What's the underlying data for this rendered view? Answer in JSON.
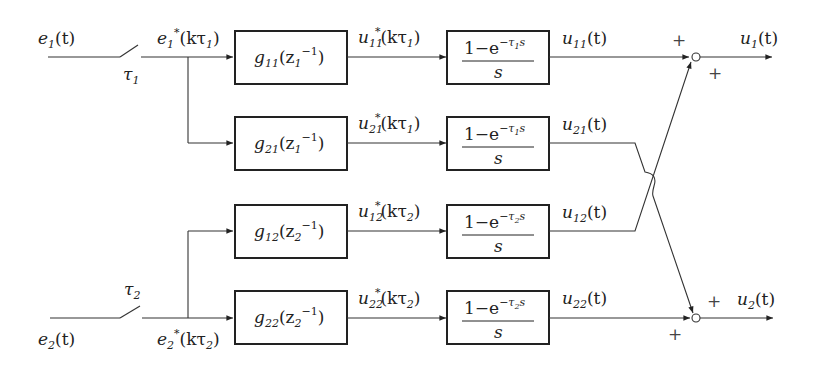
{
  "inputs": {
    "e1": {
      "base": "e",
      "sub": "1",
      "arg": "(t)"
    },
    "e2": {
      "base": "e",
      "sub": "2",
      "arg": "(t)"
    }
  },
  "samplers": {
    "s1": {
      "base": "τ",
      "sub": "1"
    },
    "s2": {
      "base": "τ",
      "sub": "2"
    }
  },
  "sampled": {
    "e1s": {
      "base": "e",
      "sub": "1",
      "sup": "*",
      "arg": "(kτ",
      "argsub": "1",
      "close": ")"
    },
    "e2s": {
      "base": "e",
      "sub": "2",
      "sup": "*",
      "arg": "(kτ",
      "argsub": "2",
      "close": ")"
    }
  },
  "controllers": [
    {
      "id": "g11",
      "base": "g",
      "sub": "11",
      "arg": "(z",
      "argsub": "1",
      "argsup": "−1",
      "close": ")"
    },
    {
      "id": "g21",
      "base": "g",
      "sub": "21",
      "arg": "(z",
      "argsub": "1",
      "argsup": "−1",
      "close": ")"
    },
    {
      "id": "g12",
      "base": "g",
      "sub": "12",
      "arg": "(z",
      "argsub": "2",
      "argsup": "−1",
      "close": ")"
    },
    {
      "id": "g22",
      "base": "g",
      "sub": "22",
      "arg": "(z",
      "argsub": "2",
      "argsup": "−1",
      "close": ")"
    }
  ],
  "controller_outputs": [
    {
      "base": "u",
      "sub": "11",
      "sup": "*",
      "arg": "(kτ",
      "argsub": "1",
      "close": ")"
    },
    {
      "base": "u",
      "sub": "21",
      "sup": "*",
      "arg": "(kτ",
      "argsub": "1",
      "close": ")"
    },
    {
      "base": "u",
      "sub": "12",
      "sup": "*",
      "arg": "(kτ",
      "argsub": "2",
      "close": ")"
    },
    {
      "base": "u",
      "sub": "22",
      "sup": "*",
      "arg": "(kτ",
      "argsub": "2",
      "close": ")"
    }
  ],
  "holds": [
    {
      "num": "1−e",
      "exp": "−τ",
      "expsub": "1",
      "expvar": "s",
      "den": "s"
    },
    {
      "num": "1−e",
      "exp": "−τ",
      "expsub": "1",
      "expvar": "s",
      "den": "s"
    },
    {
      "num": "1−e",
      "exp": "−τ",
      "expsub": "2",
      "expvar": "s",
      "den": "s"
    },
    {
      "num": "1−e",
      "exp": "−τ",
      "expsub": "2",
      "expvar": "s",
      "den": "s"
    }
  ],
  "hold_outputs": [
    {
      "base": "u",
      "sub": "11",
      "arg": "(t)"
    },
    {
      "base": "u",
      "sub": "21",
      "arg": "(t)"
    },
    {
      "base": "u",
      "sub": "12",
      "arg": "(t)"
    },
    {
      "base": "u",
      "sub": "22",
      "arg": "(t)"
    }
  ],
  "summing": {
    "j1": {
      "sign_top": "+",
      "sign_bottom": "+"
    },
    "j2": {
      "sign_top": "+",
      "sign_bottom": "+"
    }
  },
  "outputs": {
    "u1": {
      "base": "u",
      "sub": "1",
      "arg": "(t)"
    },
    "u2": {
      "base": "u",
      "sub": "2",
      "arg": "(t)"
    }
  }
}
